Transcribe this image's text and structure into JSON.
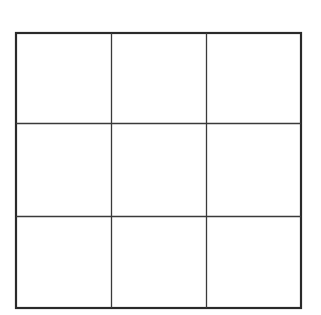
{
  "diagram": {
    "type": "grid",
    "rows": 3,
    "columns": 3,
    "cells": [
      [
        "",
        "",
        ""
      ],
      [
        "",
        "",
        ""
      ],
      [
        "",
        "",
        ""
      ]
    ],
    "colors": {
      "background": "#ffffff",
      "outer_border": "#2a2a2a",
      "inner_lines": "#3a3a3a"
    }
  }
}
